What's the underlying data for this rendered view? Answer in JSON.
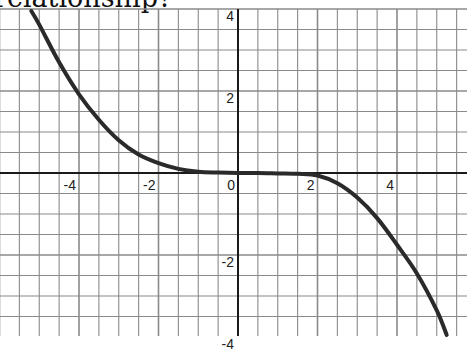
{
  "question": {
    "text": "relationship?"
  },
  "chart_data": {
    "type": "line",
    "title": "",
    "xlabel": "",
    "ylabel": "",
    "xlim": [
      -6,
      5.75
    ],
    "ylim": [
      -4,
      4
    ],
    "grid": true,
    "grid_step": 0.5,
    "x_tick_labels": [
      {
        "value": -6,
        "label": "-6"
      },
      {
        "value": -4,
        "label": "-4"
      },
      {
        "value": -2,
        "label": "-2"
      },
      {
        "value": 0,
        "label": "0"
      },
      {
        "value": 2,
        "label": "2"
      },
      {
        "value": 4,
        "label": "4"
      }
    ],
    "y_tick_labels": [
      {
        "value": 4,
        "label": "4"
      },
      {
        "value": 2,
        "label": "2"
      },
      {
        "value": -2,
        "label": "-2"
      },
      {
        "value": -4,
        "label": "-4"
      }
    ],
    "series": [
      {
        "name": "curve",
        "x": [
          -5.2,
          -5.0,
          -4.5,
          -4.0,
          -3.5,
          -3.0,
          -2.5,
          -2.0,
          -1.5,
          -1.0,
          -0.5,
          0.0,
          0.5,
          1.0,
          1.5,
          2.0,
          2.5,
          3.0,
          3.5,
          4.0,
          4.5,
          5.0,
          5.25
        ],
        "y": [
          3.95,
          3.62,
          2.7,
          1.92,
          1.3,
          0.8,
          0.45,
          0.24,
          0.1,
          0.03,
          0.01,
          0.0,
          0.0,
          -0.01,
          -0.02,
          -0.06,
          -0.25,
          -0.6,
          -1.1,
          -1.75,
          -2.45,
          -3.35,
          -3.95
        ]
      }
    ],
    "colors": {
      "curve": "#2a2a2a",
      "grid": "#8a8a8a",
      "axis": "#1a1a1a"
    }
  }
}
